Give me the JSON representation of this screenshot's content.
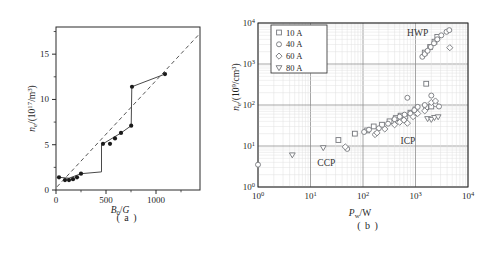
{
  "figure": {
    "background": "#ffffff"
  },
  "captions": {
    "a": "( a )",
    "b": "( b )"
  },
  "colors": {
    "frame": "#2b2b2b",
    "text": "#1f1f1f",
    "point_fill": "#1a1a1a",
    "line": "#4a4a4a",
    "dash": "#555555",
    "marker_stroke": "#75777c",
    "marker_fill": "#ffffff",
    "grid_minor": "#e0e0e0",
    "grid_major": "#8f8f8f",
    "legend_bg": "#ffffff"
  },
  "chart_data": [
    {
      "id": "a",
      "type": "line",
      "xlabel_rich": [
        [
          "B",
          "i"
        ],
        [
          "0",
          "sub"
        ],
        [
          "/",
          ""
        ],
        [
          "G",
          "i"
        ]
      ],
      "ylabel_rich": [
        [
          "n",
          "i"
        ],
        [
          "e",
          "sub"
        ],
        [
          "/(10",
          ""
        ],
        [
          "17",
          "sup"
        ],
        [
          "/m",
          ""
        ],
        [
          "3",
          "sup"
        ],
        [
          ")",
          ""
        ]
      ],
      "xlim": [
        0,
        1440
      ],
      "ylim": [
        0,
        18
      ],
      "xticks": [
        0,
        500,
        1000
      ],
      "xminor": [
        250,
        750,
        1250
      ],
      "yticks": [
        0,
        5,
        10,
        15
      ],
      "yminor": [
        2.5,
        7.5,
        12.5,
        17.5
      ],
      "grid": false,
      "dashed_line": [
        [
          10,
          0.35
        ],
        [
          1440,
          17.3
        ]
      ],
      "solid_line": [
        [
          30,
          1.4
        ],
        [
          130,
          1.3
        ],
        [
          250,
          1.8
        ],
        [
          455,
          2.0
        ],
        [
          455,
          5.0
        ],
        [
          470,
          5.1
        ],
        [
          650,
          6.3
        ],
        [
          752,
          7.1
        ],
        [
          758,
          11.4
        ],
        [
          1090,
          12.8
        ]
      ],
      "points": [
        [
          30,
          1.4
        ],
        [
          90,
          1.1
        ],
        [
          130,
          1.1
        ],
        [
          170,
          1.2
        ],
        [
          210,
          1.4
        ],
        [
          250,
          1.8
        ],
        [
          470,
          5.1
        ],
        [
          540,
          5.1
        ],
        [
          590,
          5.7
        ],
        [
          650,
          6.3
        ],
        [
          752,
          7.1
        ],
        [
          760,
          11.4
        ],
        [
          1090,
          12.8
        ]
      ]
    },
    {
      "id": "b",
      "type": "scatter",
      "xscale": "log",
      "yscale": "log",
      "xlabel_rich": [
        [
          "P",
          "i"
        ],
        [
          "w",
          "sub"
        ],
        [
          "/W",
          ""
        ]
      ],
      "ylabel_rich": [
        [
          "n",
          "i"
        ],
        [
          "e",
          "sub"
        ],
        [
          "/(10",
          ""
        ],
        [
          "9",
          "sup"
        ],
        [
          "/cm",
          ""
        ],
        [
          "3",
          "sup"
        ],
        [
          ")",
          ""
        ]
      ],
      "xlim": [
        1,
        10000
      ],
      "ylim": [
        1,
        10000
      ],
      "x_tick_exponents": [
        0,
        1,
        2,
        3,
        4
      ],
      "y_tick_exponents": [
        0,
        1,
        2,
        3,
        4
      ],
      "grid": true,
      "legend": {
        "position": "top-left",
        "items": [
          {
            "marker": "square",
            "label": "10 A"
          },
          {
            "marker": "circle",
            "label": "40 A"
          },
          {
            "marker": "diamond",
            "label": "60 A"
          },
          {
            "marker": "triangle-down",
            "label": "80 A"
          }
        ]
      },
      "annotations": [
        {
          "text": "HWP",
          "x": 1100,
          "y": 4800
        },
        {
          "text": "ICP",
          "x": 720,
          "y": 11.5
        },
        {
          "text": "CCP",
          "x": 20,
          "y": 3.2
        }
      ],
      "series": [
        {
          "name": "10 A",
          "marker": "square",
          "points": [
            [
              34,
              14
            ],
            [
              70,
              20
            ],
            [
              120,
              24
            ],
            [
              160,
              30
            ],
            [
              230,
              33
            ],
            [
              320,
              40
            ],
            [
              420,
              48
            ],
            [
              520,
              55
            ],
            [
              640,
              52
            ],
            [
              800,
              65
            ],
            [
              1000,
              78
            ],
            [
              1600,
              330
            ],
            [
              1600,
              88
            ],
            [
              2000,
              92
            ],
            [
              1500,
              1900
            ],
            [
              1900,
              2600
            ],
            [
              2300,
              3500
            ],
            [
              2600,
              4600
            ]
          ]
        },
        {
          "name": "40 A",
          "marker": "circle",
          "points": [
            [
              1,
              3.5
            ],
            [
              50,
              8.5
            ],
            [
              105,
              22
            ],
            [
              130,
              25
            ],
            [
              200,
              27
            ],
            [
              300,
              35
            ],
            [
              400,
              45
            ],
            [
              500,
              52
            ],
            [
              620,
              58
            ],
            [
              700,
              150
            ],
            [
              800,
              62
            ],
            [
              950,
              75
            ],
            [
              1100,
              90
            ],
            [
              1500,
              100
            ],
            [
              2000,
              170
            ],
            [
              2400,
              105
            ],
            [
              2800,
              92
            ],
            [
              1350,
              1500
            ],
            [
              1500,
              1750
            ],
            [
              1700,
              2100
            ],
            [
              1950,
              2600
            ],
            [
              2250,
              3200
            ],
            [
              2600,
              4000
            ],
            [
              3100,
              5000
            ],
            [
              3900,
              6100
            ],
            [
              4400,
              6700
            ]
          ]
        },
        {
          "name": "60 A",
          "marker": "diamond",
          "points": [
            [
              46,
              9.5
            ],
            [
              170,
              19
            ],
            [
              185,
              21
            ],
            [
              260,
              26
            ],
            [
              400,
              33
            ],
            [
              500,
              38
            ],
            [
              600,
              43
            ],
            [
              700,
              36
            ],
            [
              900,
              52
            ],
            [
              1100,
              62
            ],
            [
              1500,
              72
            ],
            [
              2000,
              115
            ],
            [
              2400,
              125
            ],
            [
              4500,
              2500
            ]
          ]
        },
        {
          "name": "80 A",
          "marker": "triangle-down",
          "points": [
            [
              4.5,
              6
            ],
            [
              17.5,
              9
            ],
            [
              1700,
              46
            ],
            [
              2000,
              44
            ],
            [
              2300,
              49
            ],
            [
              2700,
              51
            ]
          ]
        }
      ]
    }
  ]
}
